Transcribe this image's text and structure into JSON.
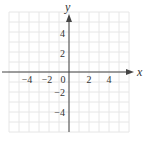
{
  "chart_data": {
    "type": "scatter",
    "title": "",
    "xlabel": "x",
    "ylabel": "y",
    "xlim": [
      -6,
      6
    ],
    "ylim": [
      -6,
      6
    ],
    "grid": true,
    "x_ticks": [
      -4,
      -2,
      0,
      2,
      4
    ],
    "y_ticks": [
      4,
      2,
      -2,
      -4
    ],
    "x_tick_labels": [
      "−4",
      "−2",
      "0",
      "2",
      "4"
    ],
    "y_tick_labels": [
      "4",
      "2",
      "−2",
      "−4"
    ],
    "series": []
  },
  "axes": {
    "x_label": "x",
    "y_label": "y"
  },
  "colors": {
    "grid": "#e6e6e6",
    "axis": "#444444",
    "text": "#333333"
  }
}
